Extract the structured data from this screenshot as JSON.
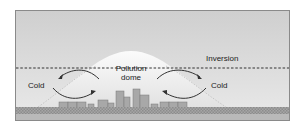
{
  "diagram": {
    "labels": {
      "inversion": "Inversion",
      "cold_left": "Cold",
      "cold_right": "Cold",
      "dome_line1": "Pollution",
      "dome_line2": "dome"
    },
    "colors": {
      "sky_top": "#cfcfcf",
      "sky_bottom": "#e9e9e9",
      "dome": "#f7f7f7",
      "buildings": "#a8a8a8",
      "ground": "#9a9a9a",
      "inversion_line": "#333333",
      "arrows": "#333333"
    }
  }
}
